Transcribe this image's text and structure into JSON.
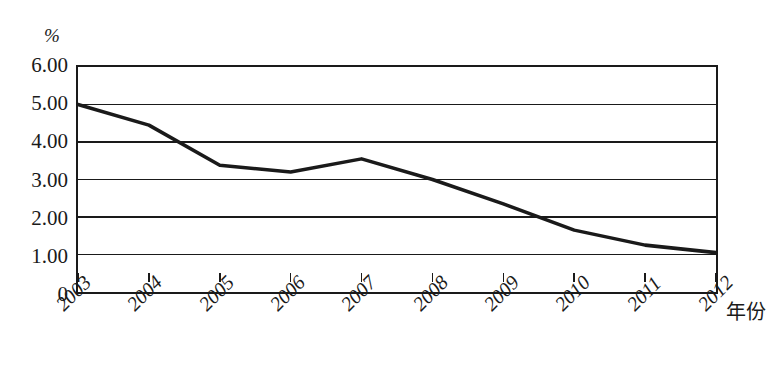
{
  "chart_data": {
    "type": "line",
    "title": "",
    "xlabel": "年份",
    "ylabel": "",
    "unit_label": "%",
    "grid": true,
    "legend": "none",
    "categories": [
      "2003",
      "2004",
      "2005",
      "2006",
      "2007",
      "2008",
      "2009",
      "2010",
      "2011",
      "2012"
    ],
    "values": [
      5.0,
      4.45,
      3.38,
      3.2,
      3.55,
      3.0,
      2.35,
      1.65,
      1.25,
      1.05
    ],
    "series": [
      {
        "name": "",
        "values": [
          5.0,
          4.45,
          3.38,
          3.2,
          3.55,
          3.0,
          2.35,
          1.65,
          1.25,
          1.05
        ],
        "color": "#1a1a1a"
      }
    ],
    "ylim": [
      0,
      6
    ],
    "ytick_values": [
      0,
      1,
      2,
      3,
      4,
      5,
      6
    ],
    "ytick_labels": [
      "0",
      "1.00",
      "2.00",
      "3.00",
      "4.00",
      "5.00",
      "6.00"
    ],
    "xlim": [
      2003,
      2012
    ]
  },
  "style": {
    "line_color": "#1a1a1a",
    "grid_color": "#1a1a1a",
    "axis_color": "#1a1a1a",
    "background": "#ffffff"
  }
}
